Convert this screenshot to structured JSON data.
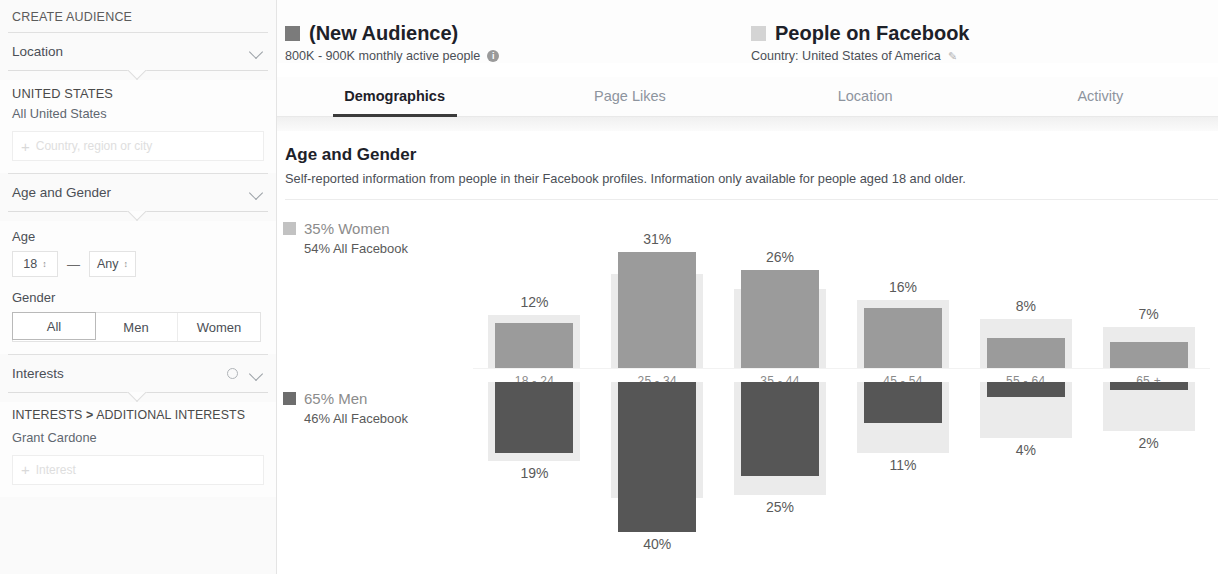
{
  "sidebar": {
    "title": "CREATE AUDIENCE",
    "location_section": {
      "label": "Location",
      "chevron": "chevron-down-icon",
      "country_heading": "UNITED STATES",
      "country_value": "All United States",
      "add_placeholder": "Country, region or city",
      "add_plus": "+"
    },
    "age_gender_section": {
      "label": "Age and Gender",
      "chevron": "chevron-down-icon",
      "age_label": "Age",
      "age_min": "18",
      "age_max": "Any",
      "age_dash": "—",
      "stepper_glyph": "↕",
      "gender_label": "Gender",
      "gender_options": [
        "All",
        "Men",
        "Women"
      ],
      "gender_selected": "All"
    },
    "interests_section": {
      "label": "Interests",
      "gear": "gear-icon",
      "chevron": "chevron-down-icon",
      "breadcrumb_root": "INTERESTS",
      "breadcrumb_sep": ">",
      "breadcrumb_leaf": "ADDITIONAL INTERESTS",
      "interest_items": [
        "Grant Cardone"
      ],
      "add_placeholder": "Interest",
      "add_plus": "+"
    }
  },
  "header": {
    "audience": {
      "icon": "audience-square-icon",
      "title": "(New Audience)",
      "subtitle": "800K - 900K monthly active people",
      "info_glyph": "i"
    },
    "comparison": {
      "icon": "people-square-icon",
      "title": "People on Facebook",
      "subtitle": "Country: United States of America",
      "edit_glyph": "✎"
    }
  },
  "tabs": [
    {
      "label": "Demographics",
      "active": true
    },
    {
      "label": "Page Likes",
      "active": false
    },
    {
      "label": "Location",
      "active": false
    },
    {
      "label": "Activity",
      "active": false
    }
  ],
  "section": {
    "title": "Age and Gender",
    "description": "Self-reported information from people in their Facebook profiles. Information only available for people aged 18 and older."
  },
  "colors": {
    "women_bar": "#9b9b9b",
    "men_bar": "#565656",
    "benchmark_bar": "#ebebeb",
    "active_tab_underline": "#3b3b3b",
    "text_primary": "#1d2129",
    "text_secondary": "#4b4f56"
  },
  "chart_data": {
    "type": "bar",
    "title": "Age and Gender",
    "subtitle": "Self-reported information from people in their Facebook profiles. Information only available for people aged 18 and older.",
    "xlabel": "",
    "ylabel": "",
    "grid": false,
    "legend_position": "left",
    "orientation": "back-to-back-vertical",
    "categories": [
      "18 - 24",
      "25 - 34",
      "35 - 44",
      "45 - 54",
      "55 - 64",
      "65 +"
    ],
    "ylim": [
      0,
      40
    ],
    "legend": [
      {
        "name": "Women",
        "share": "35% Women",
        "benchmark": "54% All Facebook",
        "color": "#9b9b9b"
      },
      {
        "name": "Men",
        "share": "65% Men",
        "benchmark": "46% All Facebook",
        "color": "#565656"
      }
    ],
    "series": [
      {
        "name": "Women",
        "direction": "up",
        "values": [
          12,
          31,
          26,
          16,
          8,
          7
        ],
        "labels": [
          "12%",
          "31%",
          "26%",
          "16%",
          "8%",
          "7%"
        ],
        "benchmark_values": [
          14,
          25,
          21,
          18,
          13,
          11
        ]
      },
      {
        "name": "Men",
        "direction": "down",
        "values": [
          19,
          40,
          25,
          11,
          4,
          2
        ],
        "labels": [
          "19%",
          "40%",
          "25%",
          "11%",
          "4%",
          "2%"
        ],
        "benchmark_values": [
          21,
          31,
          30,
          19,
          15,
          13
        ]
      }
    ]
  }
}
